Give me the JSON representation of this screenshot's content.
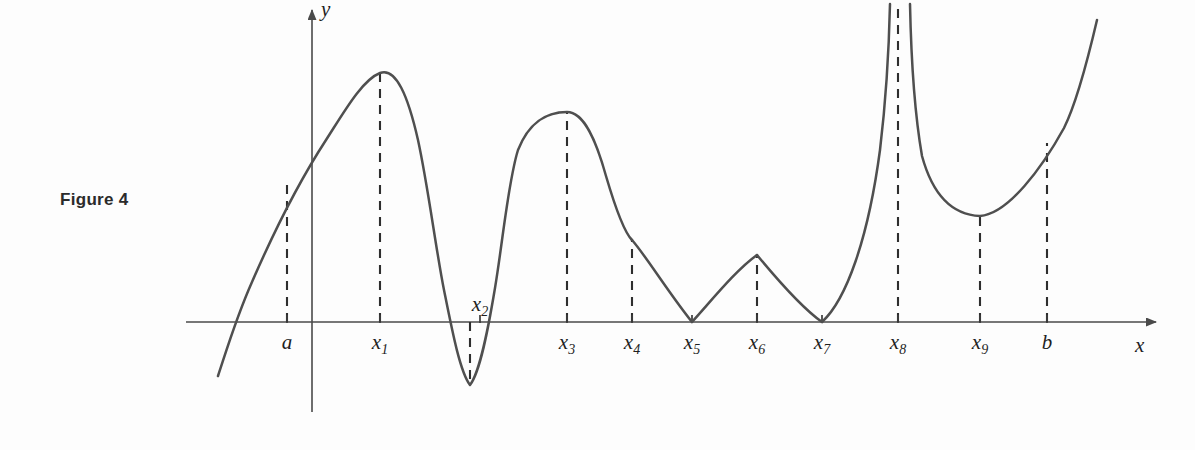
{
  "figure": {
    "caption": "Figure 4",
    "background_color": "#fdfdfd",
    "curve_color": "#4f4f4f",
    "axis_color": "#4a4a4a",
    "dash_color": "#2e2e2e"
  },
  "axes": {
    "x_axis_label": "x",
    "y_axis_label": "y",
    "x_axis_y_px": 322,
    "y_axis_x_px": 312,
    "x_axis_start_px": 186,
    "x_axis_end_px": 1162,
    "y_axis_top_px": 4,
    "y_axis_bottom_px": 412
  },
  "tick_labels": [
    {
      "name": "a",
      "base": "a",
      "sub": "",
      "x": 287,
      "label_y": 349,
      "label_above_axis": false
    },
    {
      "name": "x1",
      "base": "x",
      "sub": "1",
      "x": 380,
      "label_y": 349,
      "label_above_axis": false
    },
    {
      "name": "x2",
      "base": "x",
      "sub": "2",
      "x": 480,
      "label_y": 311,
      "label_above_axis": true
    },
    {
      "name": "x3",
      "base": "x",
      "sub": "3",
      "x": 567,
      "label_y": 349,
      "label_above_axis": false
    },
    {
      "name": "x4",
      "base": "x",
      "sub": "4",
      "x": 632,
      "label_y": 349,
      "label_above_axis": false
    },
    {
      "name": "x5",
      "base": "x",
      "sub": "5",
      "x": 692,
      "label_y": 349,
      "label_above_axis": false
    },
    {
      "name": "x6",
      "base": "x",
      "sub": "6",
      "x": 757,
      "label_y": 349,
      "label_above_axis": false
    },
    {
      "name": "x7",
      "base": "x",
      "sub": "7",
      "x": 822,
      "label_y": 349,
      "label_above_axis": false
    },
    {
      "name": "x8",
      "base": "x",
      "sub": "8",
      "x": 898,
      "label_y": 349,
      "label_above_axis": false
    },
    {
      "name": "x9",
      "base": "x",
      "sub": "9",
      "x": 980,
      "label_y": 349,
      "label_above_axis": false
    },
    {
      "name": "b",
      "base": "b",
      "sub": "",
      "x": 1047,
      "label_y": 349,
      "label_above_axis": false
    }
  ],
  "chart_data": {
    "type": "line",
    "title": "Figure 4",
    "xlabel": "x",
    "ylabel": "y",
    "grid": false,
    "legend": "none",
    "axis_crossings_px": [
      232,
      440,
      508,
      692,
      822
    ],
    "critical_points": [
      {
        "label": "a",
        "x_px": 287,
        "y_px": 185,
        "kind": "endpoint-of-interval",
        "feature": "left endpoint a"
      },
      {
        "label": "x1",
        "x_px": 380,
        "y_px": 73,
        "kind": "smooth-maximum",
        "feature": "local maximum"
      },
      {
        "label": "x2",
        "x_px": 470,
        "y_px": 385,
        "kind": "smooth-minimum",
        "feature": "absolute minimum"
      },
      {
        "label": "x3",
        "x_px": 567,
        "y_px": 112,
        "kind": "smooth-maximum",
        "feature": "local maximum"
      },
      {
        "label": "x4",
        "x_px": 632,
        "y_px": 240,
        "kind": "corner",
        "feature": "corner, not an extremum"
      },
      {
        "label": "x5",
        "x_px": 692,
        "y_px": 322,
        "kind": "cusp-minimum",
        "feature": "local minimum at a cusp"
      },
      {
        "label": "x6",
        "x_px": 757,
        "y_px": 255,
        "kind": "corner-maximum",
        "feature": "local maximum at a corner"
      },
      {
        "label": "x7",
        "x_px": 822,
        "y_px": 322,
        "kind": "cusp-minimum",
        "feature": "local minimum at a cusp"
      },
      {
        "label": "x8",
        "x_px": 898,
        "y_px": 0,
        "kind": "vertical-asymptote",
        "feature": "vertical asymptote, function undefined"
      },
      {
        "label": "x9",
        "x_px": 980,
        "y_px": 215,
        "kind": "smooth-minimum",
        "feature": "local minimum"
      },
      {
        "label": "b",
        "x_px": 1047,
        "y_px": 143,
        "kind": "endpoint-of-interval",
        "feature": "right endpoint b"
      }
    ],
    "dashed_guides": [
      {
        "label": "a",
        "x": 287,
        "from_y": 322,
        "to_y": 185
      },
      {
        "label": "x1",
        "x": 380,
        "from_y": 322,
        "to_y": 73
      },
      {
        "label": "x2",
        "x": 470,
        "from_y": 322,
        "to_y": 385
      },
      {
        "label": "x3",
        "x": 567,
        "from_y": 322,
        "to_y": 112
      },
      {
        "label": "x4",
        "x": 632,
        "from_y": 322,
        "to_y": 240
      },
      {
        "label": "x6",
        "x": 757,
        "from_y": 322,
        "to_y": 255
      },
      {
        "label": "x8",
        "x": 898,
        "from_y": 322,
        "to_y": 4
      },
      {
        "label": "x9",
        "x": 980,
        "from_y": 322,
        "to_y": 215
      },
      {
        "label": "b",
        "x": 1047,
        "from_y": 322,
        "to_y": 143
      }
    ],
    "curve_segments": [
      {
        "name": "left-branch-through-x1-x2-x3-to-x4",
        "path": "M 218,376 C 226,352 236,318 252,282 C 272,236 300,180 326,140 C 344,112 362,80 380,73 C 396,67 408,96 418,140 C 428,186 436,250 444,290 C 452,330 460,372 470,385 C 480,372 488,330 495,288 C 503,240 508,182 518,150 C 530,120 548,112 567,112 C 584,112 596,140 606,176 C 616,210 624,232 632,240"
      },
      {
        "name": "corner-x4-down-to-cusp-x5",
        "path": "M 632,240 C 646,256 668,292 692,322"
      },
      {
        "name": "cusp-x5-up-to-corner-x6",
        "path": "M 692,322 C 712,300 736,270 757,255"
      },
      {
        "name": "corner-x6-down-to-cusp-x7",
        "path": "M 757,255 C 776,278 802,308 822,322"
      },
      {
        "name": "cusp-x7-up-asymptote-left-of-x8",
        "path": "M 822,322 C 846,300 868,240 880,150 C 886,100 889,48 890,4"
      },
      {
        "name": "asymptote-right-of-x8-down-to-x9-min-to-b",
        "path": "M 910,4 C 911,52 914,110 922,156 C 934,200 956,215 980,216 C 1008,214 1042,168 1064,128 C 1078,100 1090,50 1097,20"
      }
    ]
  }
}
